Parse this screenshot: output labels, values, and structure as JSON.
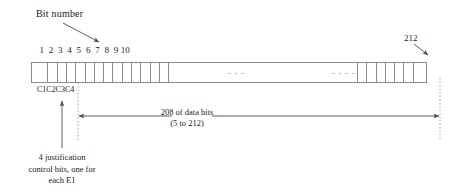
{
  "figure": {
    "title_annotation": "Bit number",
    "end_bit_annotation": "212",
    "bit_numbers": [
      "1",
      "2",
      "3",
      "4",
      "5",
      "6",
      "7",
      "8",
      "9",
      "10"
    ],
    "control_bit_labels": [
      "C1",
      "C2",
      "C3",
      "C4"
    ],
    "in_bar_ellipsis": [
      "- - -",
      "- - - -"
    ],
    "data_bits_caption": {
      "line1": "208 of data bits",
      "line2": "(5 to 212)"
    },
    "justification_caption": {
      "line1": "4 justification",
      "line2": "control bits, one for",
      "line3": "each E1"
    },
    "colors": {
      "stroke": "#8c8c8c",
      "text": "#1a1a1a",
      "arrow": "#4d4d4d",
      "dashed": "#9a9a9a"
    }
  }
}
